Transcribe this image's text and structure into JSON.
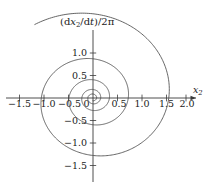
{
  "chart_data": {
    "type": "line",
    "title_parts": {
      "open": "(d",
      "var": "x",
      "var_sub": "2",
      "slash_d": "/d",
      "t": "t",
      "close": ")/2",
      "pi": "π"
    },
    "xlabel": "x",
    "xlabel_sub": "2",
    "ylabel": "",
    "xlim": [
      -1.75,
      2.15
    ],
    "ylim": [
      -1.85,
      1.5
    ],
    "grid": false,
    "legend": null,
    "xticks": [
      -1.5,
      -1.0,
      -0.5,
      0.5,
      1.0,
      1.5,
      2.0
    ],
    "xtick_labels": [
      "−1.5",
      "−1.0",
      "−0.5",
      "0.5",
      "1.0",
      "1.5",
      "2.0"
    ],
    "yticks": [
      1.0,
      0.5,
      -0.5,
      -1.0,
      -1.5
    ],
    "ytick_labels": [
      "1.0",
      "0.5",
      "−0.5",
      "−1.0",
      "−1.5"
    ],
    "zero_label": "0",
    "series": [
      {
        "name": "spiral-trajectory",
        "kind": "spiral",
        "turns": 4.6,
        "r_start": 0.06,
        "r_end": 2.02,
        "theta_start_deg": 0,
        "theta_end_deg": 1656,
        "color": "#4a4a4a"
      }
    ],
    "radii_at_axis_crossings": [
      0.1,
      0.22,
      0.36,
      0.52,
      0.72,
      1.0,
      1.22,
      1.45,
      1.75,
      2.0
    ]
  },
  "figure": {
    "background": "#ffffff",
    "axis_color": "#3b3b3b",
    "curve_color": "#4a4a4a",
    "text_color": "#1a1a1a"
  }
}
